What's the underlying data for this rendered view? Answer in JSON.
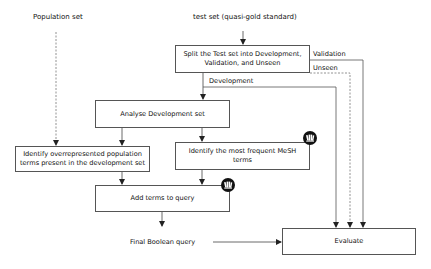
{
  "diagram": {
    "inputs": {
      "population_set": "Population set",
      "test_set": "test set (quasi-gold standard)"
    },
    "boxes": {
      "split": "Split the Test set into Development, Validation, and Unseen",
      "analyse": "Analyse Development set",
      "identify_population": "Identify overrepresented population terms present in the development set",
      "identify_mesh": "Identify the most frequent MeSH terms",
      "add_terms": "Add terms to query",
      "evaluate": "Evaluate"
    },
    "edge_labels": {
      "validation": "Validation",
      "unseen": "Unseen",
      "development": "Development"
    },
    "output": {
      "final_query": "Final Boolean query"
    },
    "icons": [
      "library-books-icon",
      "library-books-icon"
    ],
    "colors": {
      "line": "#555555",
      "text": "#111111",
      "icon_bg": "#111111"
    }
  }
}
